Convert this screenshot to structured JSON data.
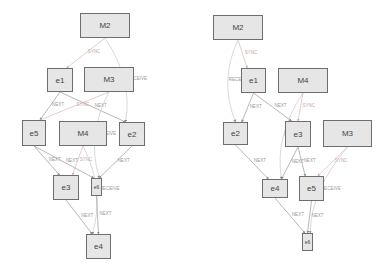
{
  "diagrams": [
    {
      "name": "left",
      "nodes": [
        {
          "id": "M2",
          "label": "M2",
          "x": 80,
          "y": 13,
          "w": 50,
          "h": 25
        },
        {
          "id": "e1",
          "label": "e1",
          "x": 47,
          "y": 68,
          "w": 26,
          "h": 24
        },
        {
          "id": "M3",
          "label": "M3",
          "x": 84,
          "y": 67,
          "w": 50,
          "h": 25
        },
        {
          "id": "e5",
          "label": "e5",
          "x": 22,
          "y": 120,
          "w": 24,
          "h": 26
        },
        {
          "id": "M4",
          "label": "M4",
          "x": 59,
          "y": 121,
          "w": 48,
          "h": 25
        },
        {
          "id": "e2",
          "label": "e2",
          "x": 119,
          "y": 122,
          "w": 26,
          "h": 24
        },
        {
          "id": "e3",
          "label": "e3",
          "x": 53,
          "y": 175,
          "w": 26,
          "h": 25
        },
        {
          "id": "e6",
          "label": "e6",
          "x": 91,
          "y": 178,
          "w": 11,
          "h": 18
        },
        {
          "id": "e4",
          "label": "e4",
          "x": 86,
          "y": 234,
          "w": 25,
          "h": 25
        }
      ],
      "edges": [
        {
          "from": "M2",
          "to": "e1",
          "label": "SYNC"
        },
        {
          "from": "M2",
          "to": "e2",
          "label": "RECEIVE"
        },
        {
          "from": "e1",
          "to": "e5",
          "label": "NEXT"
        },
        {
          "from": "e1",
          "to": "e2",
          "label": "NEXT"
        },
        {
          "from": "M3",
          "to": "e5",
          "label": "SYNC"
        },
        {
          "from": "M3",
          "to": "e6",
          "label": "RECEIVE"
        },
        {
          "from": "e5",
          "to": "e3",
          "label": "NEXT"
        },
        {
          "from": "e5",
          "to": "e6",
          "label": "NEXT"
        },
        {
          "from": "M4",
          "to": "e3",
          "label": "SYNC"
        },
        {
          "from": "M4",
          "to": "e4",
          "label": "RECEIVE"
        },
        {
          "from": "e2",
          "to": "e6",
          "label": "NEXT"
        },
        {
          "from": "e3",
          "to": "e4",
          "label": "NEXT"
        },
        {
          "from": "e6",
          "to": "e4",
          "label": "NEXT"
        }
      ]
    },
    {
      "name": "right",
      "nodes": [
        {
          "id": "M2",
          "label": "M2",
          "x": 213,
          "y": 15,
          "w": 50,
          "h": 25
        },
        {
          "id": "e1",
          "label": "e1",
          "x": 241,
          "y": 68,
          "w": 25,
          "h": 25
        },
        {
          "id": "M4",
          "label": "M4",
          "x": 278,
          "y": 68,
          "w": 50,
          "h": 25
        },
        {
          "id": "e2",
          "label": "e2",
          "x": 223,
          "y": 122,
          "w": 25,
          "h": 23
        },
        {
          "id": "e3",
          "label": "e3",
          "x": 285,
          "y": 121,
          "w": 26,
          "h": 26
        },
        {
          "id": "M3",
          "label": "M3",
          "x": 323,
          "y": 120,
          "w": 49,
          "h": 27
        },
        {
          "id": "e4",
          "label": "e4",
          "x": 262,
          "y": 179,
          "w": 26,
          "h": 19
        },
        {
          "id": "e5",
          "label": "e5",
          "x": 299,
          "y": 176,
          "w": 25,
          "h": 25
        },
        {
          "id": "e6",
          "label": "e6",
          "x": 302,
          "y": 233,
          "w": 11,
          "h": 18
        }
      ],
      "edges": [
        {
          "from": "M2",
          "to": "e1",
          "label": "SYNC"
        },
        {
          "from": "M2",
          "to": "e2",
          "label": "RECEIVE"
        },
        {
          "from": "e1",
          "to": "e2",
          "label": "NEXT"
        },
        {
          "from": "e1",
          "to": "e3",
          "label": "NEXT"
        },
        {
          "from": "M4",
          "to": "e3",
          "label": "SYNC"
        },
        {
          "from": "M4",
          "to": "e4",
          "label": "RECEIVE"
        },
        {
          "from": "e2",
          "to": "e4",
          "label": "NEXT"
        },
        {
          "from": "e3",
          "to": "e4",
          "label": "NEXT"
        },
        {
          "from": "e3",
          "to": "e5",
          "label": "NEXT"
        },
        {
          "from": "M3",
          "to": "e5",
          "label": "SYNC"
        },
        {
          "from": "M3",
          "to": "e6",
          "label": "RECEIVE"
        },
        {
          "from": "e4",
          "to": "e6",
          "label": "NEXT"
        },
        {
          "from": "e5",
          "to": "e6",
          "label": "NEXT"
        }
      ]
    }
  ],
  "colors": {
    "node_fill": "#e6e6e6",
    "node_border": "#6e6e6e",
    "edge_next": "#9a9a9a",
    "edge_sync": "#d8b8b8",
    "edge_receive": "#c8c8c8"
  }
}
